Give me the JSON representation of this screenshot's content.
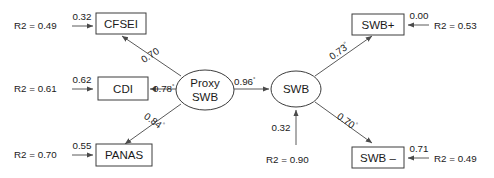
{
  "diagram": {
    "type": "path-diagram",
    "colors": {
      "background": "#ffffff",
      "stroke": "#3c3c3c",
      "path": "#5a5a5a",
      "text": "#1a1a1a"
    },
    "nodes": {
      "cfsei": "CFSEI",
      "cdi": "CDI",
      "panas": "PANAS",
      "proxy_swb_line1": "Proxy",
      "proxy_swb_line2": "SWB",
      "swb": "SWB",
      "swb_plus": "SWB+",
      "swb_minus": "SWB –"
    },
    "residuals": {
      "cfsei_r2": "R2 = 0.49",
      "cdi_r2": "R2 = 0.61",
      "panas_r2": "R2 = 0.70",
      "swb_r2": "R2 = 0.90",
      "swb_plus_r2": "R2 = 0.53",
      "swb_minus_r2": "R2 = 0.49"
    },
    "residual_coefficients": {
      "cfsei": "0.32",
      "cdi": "0.62",
      "panas": "0.55",
      "swb": "0.32",
      "swb_plus": "0.00",
      "swb_minus": "0.71"
    },
    "loadings": {
      "proxy_to_cfsei": "0.70",
      "proxy_to_cfsei_mark": "",
      "proxy_to_cdi": "0.78",
      "proxy_to_cdi_mark": "°",
      "proxy_to_panas": "0.84",
      "proxy_to_panas_mark": "°",
      "proxy_to_swb": "0.96",
      "proxy_to_swb_mark": "°",
      "swb_to_plus": "0.73",
      "swb_to_plus_mark": "°",
      "swb_to_minus": "0.70",
      "swb_to_minus_mark": "°"
    }
  }
}
